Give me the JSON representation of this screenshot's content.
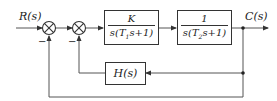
{
  "diagram": {
    "type": "control-system-block-diagram",
    "input": {
      "label": "R(s)"
    },
    "output": {
      "label": "C(s)"
    },
    "summing_junctions": [
      {
        "id": "sum1",
        "feedback_sign": "−"
      },
      {
        "id": "sum2",
        "feedback_sign": "−"
      }
    ],
    "blocks": [
      {
        "id": "G1",
        "numerator": "K",
        "denominator_prefix": "s(T",
        "denominator_sub": "1",
        "denominator_suffix": "s+1)"
      },
      {
        "id": "G2",
        "numerator": "1",
        "denominator_prefix": "s(T",
        "denominator_sub": "2",
        "denominator_suffix": "s+1)"
      },
      {
        "id": "H",
        "label": "H(s)"
      }
    ],
    "colors": {
      "line": "#555555",
      "block_border": "#333333",
      "background": "#ffffff"
    }
  }
}
